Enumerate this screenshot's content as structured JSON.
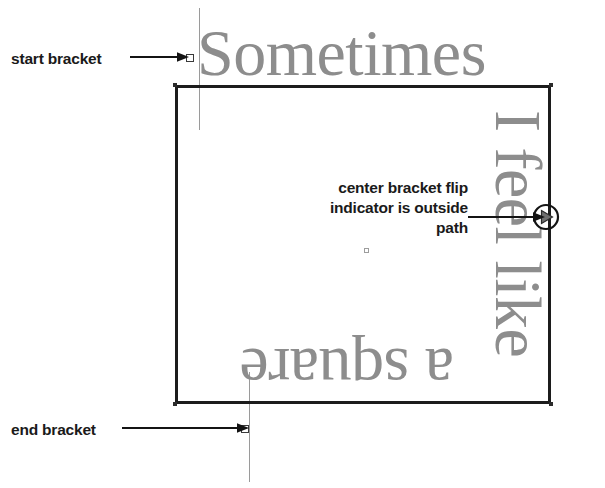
{
  "canvas": {
    "width": 605,
    "height": 488,
    "background": "#ffffff"
  },
  "artwork": {
    "shape_name": "square path",
    "stroke_color": "#1c1c1c",
    "fill_color": "none",
    "text_color": "#8d8d8d",
    "guide_color": "#9a9a9a"
  },
  "text_on_path": {
    "full_phrase": "Sometimes I feel like a square",
    "segments": [
      {
        "id": "top",
        "content": "Sometimes",
        "edge": "top",
        "rotation": 0,
        "flipped": false
      },
      {
        "id": "right",
        "content": "I feel like",
        "edge": "right",
        "rotation": 90,
        "flipped": false
      },
      {
        "id": "bottom",
        "content": "a square",
        "edge": "bottom",
        "rotation": 180,
        "flipped": true
      }
    ]
  },
  "annotations": [
    {
      "id": "start-bracket",
      "label": "start bracket",
      "lines": [
        "start bracket"
      ],
      "arrow": "right-arrow"
    },
    {
      "id": "center-bracket",
      "label": "center bracket flip indicator is outside path",
      "lines": [
        "center bracket flip",
        "indicator is outside path"
      ],
      "arrow": "right-arrow"
    },
    {
      "id": "end-bracket",
      "label": "end bracket",
      "lines": [
        "end bracket"
      ],
      "arrow": "right-arrow"
    }
  ],
  "handles": {
    "start_bracket_handle": "square-handle",
    "end_bracket_handle": "square-handle",
    "center_point": "center-point-marker",
    "flip_indicator": "circle-flip-indicator"
  }
}
